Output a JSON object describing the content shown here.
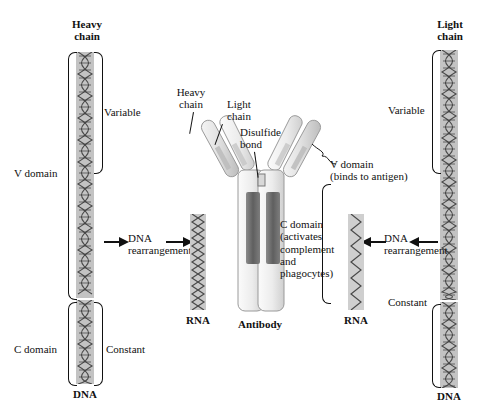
{
  "figure": {
    "background": "#ffffff",
    "ink": "#111111"
  },
  "left_panel": {
    "chain_title": "Heavy\nchain",
    "variable_label": "Variable",
    "constant_label": "Constant",
    "v_domain_label": "V domain",
    "c_domain_label": "C domain",
    "dna_label": "DNA",
    "rna_label": "RNA",
    "rearrangement_label": "DNA\nrearrangement"
  },
  "right_panel": {
    "chain_title": "Light\nchain",
    "variable_label": "Variable",
    "constant_label": "Constant",
    "dna_label": "DNA",
    "rna_label": "RNA",
    "rearrangement_label": "DNA\nrearrangement"
  },
  "center_panel": {
    "antibody_label": "Antibody",
    "heavy_chain_label": "Heavy\nchain",
    "light_chain_label": "Light\nchain",
    "disulfide_label": "Disulfide\nbond",
    "v_domain_label": "V domain\n(binds to antigen)",
    "c_domain_label": "C domain\n(activates\ncomplement\nand\nphagocytes)"
  },
  "colors": {
    "strand_fill": "#bdbdbd",
    "strand_fill_light": "#d2d2d2",
    "helix_stroke": "#4a4a4a",
    "antibody_light": "#e8e8e8",
    "antibody_mid": "#c9c9c9",
    "antibody_dark": "#6e6e6e",
    "outline": "#9a9a9a"
  }
}
